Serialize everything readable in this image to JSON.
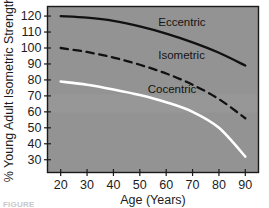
{
  "chart_data": {
    "type": "line",
    "title": "",
    "xlabel": "Age (Years)",
    "ylabel": "% Young Adult Isometric Strength",
    "xlim": [
      15,
      95
    ],
    "ylim": [
      22,
      126
    ],
    "xticks": [
      20,
      30,
      40,
      50,
      60,
      70,
      80,
      90
    ],
    "yticks": [
      30,
      40,
      50,
      60,
      70,
      80,
      90,
      100,
      110,
      120
    ],
    "grid": false,
    "legend": "inline-labels",
    "plot_background": "#939393",
    "x": [
      20,
      30,
      40,
      50,
      60,
      70,
      80,
      90
    ],
    "series": [
      {
        "name": "Eccentric",
        "style": "solid",
        "color": "#111111",
        "values": [
          120,
          119,
          117,
          113.5,
          109,
          103.5,
          97,
          89
        ],
        "label_text": "Eccentric"
      },
      {
        "name": "Isometric",
        "style": "dashed",
        "color": "#111111",
        "values": [
          100,
          97.5,
          94,
          89.5,
          84,
          77,
          68,
          56
        ],
        "label_text": "Isometric"
      },
      {
        "name": "Cocentric",
        "style": "solid",
        "color": "#ffffff",
        "values": [
          79,
          77,
          74,
          70.5,
          66,
          60,
          50,
          32
        ],
        "label_text": "Cocentric"
      }
    ],
    "annotations": [
      {
        "text": "Eccentric",
        "x": 57,
        "y": 114
      },
      {
        "text": "Isometric",
        "x": 57,
        "y": 93
      },
      {
        "text": "Cocentric",
        "x": 53,
        "y": 72
      }
    ]
  },
  "caption": {
    "text": "FIGURE"
  }
}
